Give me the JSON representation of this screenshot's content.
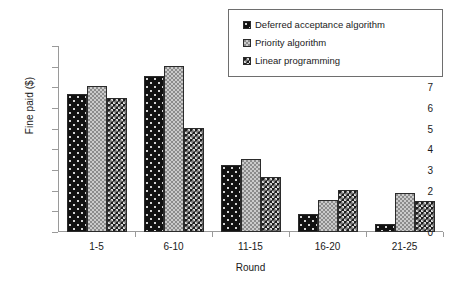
{
  "chart_data": {
    "type": "bar",
    "title": "",
    "xlabel": "Round",
    "ylabel": "Fine paid ($)",
    "categories": [
      "1-5",
      "6-10",
      "11-15",
      "16-20",
      "21-25"
    ],
    "series": [
      {
        "name": "Deferred acceptance algorithm",
        "values": [
          6.7,
          7.55,
          3.25,
          0.85,
          0.4
        ],
        "color": "#111111",
        "pattern": "dotted-black"
      },
      {
        "name": "Priority algorithm",
        "values": [
          7.05,
          8.05,
          3.55,
          1.55,
          1.9
        ],
        "color": "#8c8c8c",
        "pattern": "checker-gray"
      },
      {
        "name": "Linear programming",
        "values": [
          6.5,
          5.05,
          2.65,
          2.05,
          1.5
        ],
        "color": "#1d1d1d",
        "pattern": "checker-dark"
      }
    ],
    "ylim": [
      0,
      9
    ],
    "ytick_labels": [
      "0",
      "1",
      "2",
      "3",
      "4",
      "5",
      "6",
      "7",
      "8",
      "9"
    ],
    "ytick_values": [
      0,
      1,
      2,
      3,
      4,
      5,
      6,
      7,
      8,
      9
    ],
    "grid": false,
    "legend_position": "top-right"
  },
  "legend": {
    "items": [
      {
        "label": "Deferred acceptance algorithm"
      },
      {
        "label": "Priority algorithm"
      },
      {
        "label": "Linear programming"
      }
    ]
  }
}
